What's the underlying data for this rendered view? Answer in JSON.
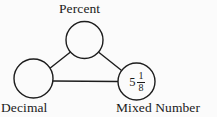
{
  "diagram": {
    "type": "triangle-node-graph",
    "background_color": "#fbfbfb",
    "stroke_color": "#1d1d1d",
    "text_color": "#1a1a1a",
    "nodes": [
      {
        "id": "percent",
        "label": "Percent",
        "label_position": "above",
        "value": "",
        "cx": 84.5,
        "cy": 40,
        "r": 18.5
      },
      {
        "id": "decimal",
        "label": "Decimal",
        "label_position": "below",
        "value": "",
        "cx": 33.5,
        "cy": 78.5,
        "r": 19.5
      },
      {
        "id": "mixed-number",
        "label": "Mixed Number",
        "label_position": "below",
        "value": "5 1/8",
        "whole": "5",
        "numerator": "1",
        "denominator": "8",
        "cx": 136.5,
        "cy": 81.5,
        "r": 18.5
      }
    ],
    "edges": [
      {
        "from": "decimal",
        "to": "percent"
      },
      {
        "from": "percent",
        "to": "mixed-number"
      },
      {
        "from": "decimal",
        "to": "mixed-number"
      }
    ]
  }
}
